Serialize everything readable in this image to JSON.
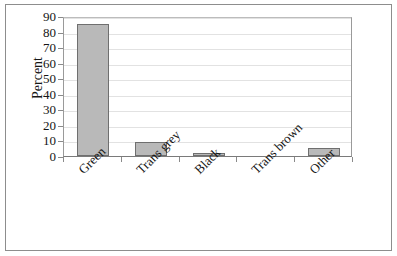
{
  "chart_data": {
    "type": "bar",
    "title": "",
    "subtitle": "",
    "xlabel": "",
    "ylabel": "Percent",
    "categories": [
      "Green",
      "Trans grey",
      "Black",
      "Trans brown",
      "Other"
    ],
    "values": [
      85,
      9,
      2,
      0,
      5
    ],
    "ylim": [
      0,
      90
    ],
    "yticks": [
      0,
      10,
      20,
      30,
      40,
      50,
      60,
      70,
      80,
      90
    ],
    "ytick_labels": [
      "0",
      "10",
      "20",
      "30",
      "40",
      "50",
      "60",
      "70",
      "80",
      "90"
    ],
    "grid": true,
    "legend": null,
    "bar_color": "#b9b9b9",
    "bar_border_color": "#6f6f6f",
    "gridline_color": "#e2e2e2",
    "axis_color": "#8a8a8a",
    "frame_color": "#8d8d8d",
    "text_color": "#151515",
    "label_rotation_deg": -45
  }
}
